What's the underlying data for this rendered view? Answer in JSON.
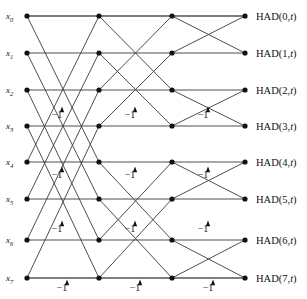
{
  "diagram": {
    "type": "butterfly-signal-flow-graph",
    "stages": 3,
    "size": 8,
    "colors": {
      "edge": "#3a3a3a",
      "node": "#111111",
      "text": "#111111",
      "background": "#ffffff"
    },
    "geometry": {
      "columns_x": [
        27,
        99,
        172,
        245
      ],
      "rows_y": [
        16,
        53,
        90,
        126,
        162,
        199,
        240,
        278
      ],
      "node_radius": 2.6
    }
  },
  "inputs": {
    "base": "x",
    "items": [
      {
        "name": "x0",
        "base": "x",
        "sub": "0",
        "row": 0
      },
      {
        "name": "x1",
        "base": "x",
        "sub": "1",
        "row": 1
      },
      {
        "name": "x2",
        "base": "x",
        "sub": "2",
        "row": 2
      },
      {
        "name": "x3",
        "base": "x",
        "sub": "3",
        "row": 3
      },
      {
        "name": "x4",
        "base": "x",
        "sub": "4",
        "row": 4
      },
      {
        "name": "x5",
        "base": "x",
        "sub": "5",
        "row": 5
      },
      {
        "name": "x6",
        "base": "x",
        "sub": "6",
        "row": 6
      },
      {
        "name": "x7",
        "base": "x",
        "sub": "7",
        "row": 7
      }
    ]
  },
  "outputs": {
    "items": [
      {
        "label": "HAD(0,t)",
        "prefix": "HAD(0,",
        "italic": "t",
        "suffix": ")",
        "row": 0
      },
      {
        "label": "HAD(1,t)",
        "prefix": "HAD(1,",
        "italic": "t",
        "suffix": ")",
        "row": 1
      },
      {
        "label": "HAD(2,t)",
        "prefix": "HAD(2,",
        "italic": "t",
        "suffix": ")",
        "row": 2
      },
      {
        "label": "HAD(3,t)",
        "prefix": "HAD(3,",
        "italic": "t",
        "suffix": ")",
        "row": 3
      },
      {
        "label": "HAD(4,t)",
        "prefix": "HAD(4,",
        "italic": "t",
        "suffix": ")",
        "row": 4
      },
      {
        "label": "HAD(5,t)",
        "prefix": "HAD(5,",
        "italic": "t",
        "suffix": ")",
        "row": 5
      },
      {
        "label": "HAD(6,t)",
        "prefix": "HAD(6,",
        "italic": "t",
        "suffix": ")",
        "row": 6
      },
      {
        "label": "HAD(7,t)",
        "prefix": "HAD(7,",
        "italic": "t",
        "suffix": ")",
        "row": 7
      }
    ]
  },
  "weights": {
    "text": "−1",
    "items": [
      {
        "value": "−1",
        "x": 57,
        "y": 118,
        "stage": 1,
        "row": 3
      },
      {
        "value": "−1",
        "x": 130,
        "y": 118,
        "stage": 2,
        "row": 3
      },
      {
        "value": "−1",
        "x": 203,
        "y": 118,
        "stage": 3,
        "row": 3
      },
      {
        "value": "−1",
        "x": 57,
        "y": 178,
        "stage": 1,
        "row": 4
      },
      {
        "value": "−1",
        "x": 130,
        "y": 178,
        "stage": 2,
        "row": 4
      },
      {
        "value": "−1",
        "x": 203,
        "y": 178,
        "stage": 3,
        "row": 4
      },
      {
        "value": "−1",
        "x": 57,
        "y": 232,
        "stage": 1,
        "row": 6
      },
      {
        "value": "−1",
        "x": 130,
        "y": 232,
        "stage": 2,
        "row": 6
      },
      {
        "value": "−1",
        "x": 203,
        "y": 232,
        "stage": 3,
        "row": 6
      },
      {
        "value": "−1",
        "x": 62,
        "y": 291,
        "stage": 1,
        "row": 7
      },
      {
        "value": "−1",
        "x": 135,
        "y": 291,
        "stage": 2,
        "row": 7
      },
      {
        "value": "−1",
        "x": 208,
        "y": 291,
        "stage": 3,
        "row": 7
      }
    ]
  },
  "edges": {
    "stage1": [
      {
        "from": 0,
        "to": 0
      },
      {
        "from": 0,
        "to": 4
      },
      {
        "from": 1,
        "to": 1
      },
      {
        "from": 1,
        "to": 5
      },
      {
        "from": 2,
        "to": 2
      },
      {
        "from": 2,
        "to": 6
      },
      {
        "from": 3,
        "to": 3
      },
      {
        "from": 3,
        "to": 7
      },
      {
        "from": 4,
        "to": 0
      },
      {
        "from": 4,
        "to": 4
      },
      {
        "from": 5,
        "to": 1
      },
      {
        "from": 5,
        "to": 5
      },
      {
        "from": 6,
        "to": 2
      },
      {
        "from": 6,
        "to": 6
      },
      {
        "from": 7,
        "to": 3
      },
      {
        "from": 7,
        "to": 7
      }
    ],
    "stage2": [
      {
        "from": 0,
        "to": 0
      },
      {
        "from": 0,
        "to": 2
      },
      {
        "from": 1,
        "to": 1
      },
      {
        "from": 1,
        "to": 3
      },
      {
        "from": 2,
        "to": 0
      },
      {
        "from": 2,
        "to": 2
      },
      {
        "from": 3,
        "to": 1
      },
      {
        "from": 3,
        "to": 3
      },
      {
        "from": 4,
        "to": 4
      },
      {
        "from": 4,
        "to": 6
      },
      {
        "from": 5,
        "to": 5
      },
      {
        "from": 5,
        "to": 7
      },
      {
        "from": 6,
        "to": 4
      },
      {
        "from": 6,
        "to": 6
      },
      {
        "from": 7,
        "to": 5
      },
      {
        "from": 7,
        "to": 7
      }
    ],
    "stage3": [
      {
        "from": 0,
        "to": 0
      },
      {
        "from": 0,
        "to": 1
      },
      {
        "from": 1,
        "to": 0
      },
      {
        "from": 1,
        "to": 1
      },
      {
        "from": 2,
        "to": 2
      },
      {
        "from": 2,
        "to": 3
      },
      {
        "from": 3,
        "to": 2
      },
      {
        "from": 3,
        "to": 3
      },
      {
        "from": 4,
        "to": 4
      },
      {
        "from": 4,
        "to": 5
      },
      {
        "from": 5,
        "to": 4
      },
      {
        "from": 5,
        "to": 5
      },
      {
        "from": 6,
        "to": 6
      },
      {
        "from": 6,
        "to": 7
      },
      {
        "from": 7,
        "to": 6
      },
      {
        "from": 7,
        "to": 7
      }
    ]
  }
}
